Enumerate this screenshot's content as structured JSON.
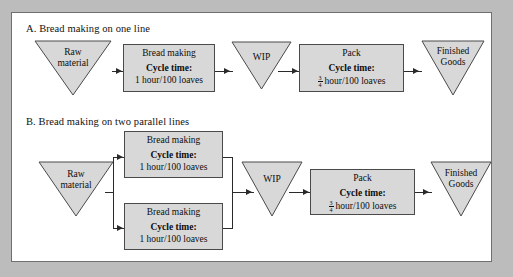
{
  "figure": {
    "sections": [
      {
        "id": "a",
        "title": "A. Bread making on one line",
        "nodes": {
          "raw": {
            "line1": "Raw",
            "line2": "material"
          },
          "bread": {
            "title": "Bread making",
            "cycle_label": "Cycle time:",
            "value": "1 hour/100 loaves"
          },
          "wip": {
            "line1": "WIP",
            "line2": ""
          },
          "pack": {
            "title": "Pack",
            "cycle_label": "Cycle time:",
            "frac_num": "3",
            "frac_den": "4",
            "value": "hour/100 loaves"
          },
          "finished": {
            "line1": "Finished",
            "line2": "Goods"
          }
        }
      },
      {
        "id": "b",
        "title": "B. Bread making on two parallel lines",
        "nodes": {
          "raw": {
            "line1": "Raw",
            "line2": "material"
          },
          "bread_top": {
            "title": "Bread making",
            "cycle_label": "Cycle time:",
            "value": "1 hour/100 loaves"
          },
          "bread_bottom": {
            "title": "Bread making",
            "cycle_label": "Cycle time:",
            "value": "1 hour/100 loaves"
          },
          "wip": {
            "line1": "WIP",
            "line2": ""
          },
          "pack": {
            "title": "Pack",
            "cycle_label": "Cycle time:",
            "frac_num": "3",
            "frac_den": "4",
            "value": "hour/100 loaves"
          },
          "finished": {
            "line1": "Finished",
            "line2": "Goods"
          }
        }
      }
    ],
    "colors": {
      "shape_fill": "#d8d8d8",
      "shape_stroke": "#4a4a4a",
      "connector": "#2a2a2a",
      "page_background": "#ffffff",
      "outer_background": "#bcbcbc"
    }
  }
}
